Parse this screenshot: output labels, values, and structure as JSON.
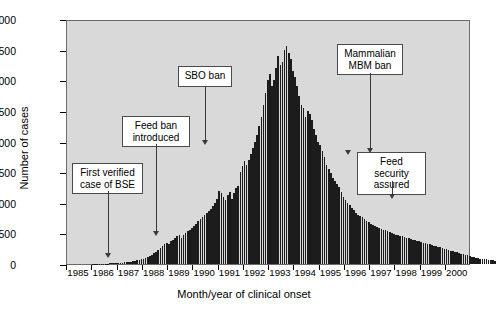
{
  "figure": {
    "background": "#ffffff",
    "plot_background": "#d9d9d9",
    "bar_color": "#1c1c1c",
    "frame_color": "#6b6b6b"
  },
  "axes": {
    "ylabel": "Number of cases",
    "xlabel": "Month/year of clinical onset",
    "yticks": [
      "0",
      "500",
      "1000",
      "1500",
      "2000",
      "2500",
      "3000",
      "3500",
      "4000"
    ],
    "xticks": [
      "1985",
      "1986",
      "1987",
      "1988",
      "1989",
      "1990",
      "1991",
      "1992",
      "1993",
      "1994",
      "1995",
      "1996",
      "1997",
      "1998",
      "1999",
      "2000"
    ]
  },
  "annotations": [
    {
      "id": "first-verified-case",
      "label": "First verified\ncase of BSE",
      "arrow_year": 1986.9
    },
    {
      "id": "feed-ban-introduced",
      "label": "Feed ban\nintroduced",
      "arrow_year": 1988.5
    },
    {
      "id": "sbo-ban",
      "label": "SBO ban",
      "arrow_year": 1990.6
    },
    {
      "id": "mammalian-mbm-ban",
      "label": "Mammalian\nMBM ban",
      "arrow_year": 1996.3
    },
    {
      "id": "feed-security-assured",
      "label": "Feed security\nassured",
      "arrow_year": 1996.3
    }
  ],
  "chart_data": {
    "type": "bar",
    "title": "",
    "subtitle": "",
    "xlabel": "Month/year of clinical onset",
    "ylabel": "Number of cases",
    "xlim": [
      1985.0,
      2001.0
    ],
    "ylim": [
      0,
      4000
    ],
    "grid": false,
    "legend": null,
    "x_tick_labels": [
      "1985",
      "1986",
      "1987",
      "1988",
      "1989",
      "1990",
      "1991",
      "1992",
      "1993",
      "1994",
      "1995",
      "1996",
      "1997",
      "1998",
      "1999",
      "2000"
    ],
    "y_tick_values": [
      0,
      500,
      1000,
      1500,
      2000,
      2500,
      3000,
      3500,
      4000
    ],
    "x_unit": "month",
    "series_name": "Confirmed BSE cases per month (Great Britain)",
    "x_start": 1985.0,
    "x_step": 0.0833333,
    "values": [
      0,
      0,
      0,
      0,
      0,
      0,
      0,
      0,
      0,
      0,
      0,
      0,
      2,
      3,
      4,
      5,
      4,
      6,
      7,
      8,
      9,
      12,
      14,
      16,
      18,
      20,
      22,
      26,
      30,
      34,
      38,
      44,
      52,
      60,
      70,
      78,
      88,
      100,
      115,
      130,
      150,
      175,
      200,
      230,
      260,
      290,
      320,
      350,
      330,
      370,
      400,
      420,
      450,
      470,
      430,
      480,
      500,
      540,
      560,
      590,
      620,
      660,
      700,
      730,
      760,
      800,
      830,
      870,
      900,
      950,
      1000,
      1060,
      1200,
      1160,
      1100,
      1050,
      1120,
      1180,
      1060,
      1160,
      1240,
      1280,
      1500,
      1600,
      1680,
      1620,
      1700,
      1800,
      1900,
      2000,
      2100,
      2250,
      2400,
      2600,
      2800,
      3000,
      3100,
      2900,
      3000,
      3200,
      3400,
      3250,
      3300,
      3500,
      3560,
      3450,
      3350,
      3150,
      3050,
      2900,
      2750,
      2600,
      2550,
      2400,
      2500,
      2450,
      2350,
      2200,
      2100,
      2000,
      1950,
      1850,
      1750,
      1620,
      1550,
      1480,
      1400,
      1350,
      1300,
      1250,
      1180,
      1100,
      1050,
      1000,
      960,
      920,
      880,
      840,
      800,
      780,
      760,
      730,
      700,
      680,
      660,
      640,
      620,
      600,
      580,
      570,
      560,
      550,
      540,
      520,
      500,
      490,
      480,
      470,
      460,
      450,
      440,
      430,
      420,
      410,
      400,
      390,
      380,
      370,
      360,
      350,
      340,
      330,
      320,
      310,
      300,
      290,
      280,
      270,
      260,
      250,
      240,
      230,
      220,
      210,
      200,
      190,
      180,
      170,
      160,
      150,
      140,
      130,
      120,
      110,
      100,
      95,
      90,
      85,
      80,
      75,
      70,
      65,
      60,
      55
    ],
    "peak": {
      "value": 3560,
      "approx_date": "1993"
    }
  }
}
